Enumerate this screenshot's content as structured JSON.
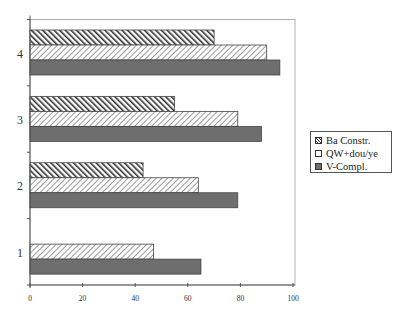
{
  "chart_data": {
    "type": "bar",
    "orientation": "horizontal",
    "title": "",
    "xlabel": "",
    "ylabel": "",
    "categories": [
      "1",
      "2",
      "3",
      "4"
    ],
    "series": [
      {
        "name": "Ba Constr.",
        "values": [
          0,
          43,
          55,
          70
        ],
        "pattern": "dense-backslash-hatch"
      },
      {
        "name": "QW+dou/ye",
        "values": [
          47,
          64,
          79,
          90
        ],
        "pattern": "light-slash-hatch"
      },
      {
        "name": "V-Compl.",
        "values": [
          65,
          79,
          88,
          95
        ],
        "pattern": "solid-dark-gray"
      }
    ],
    "xlim": [
      0,
      100
    ],
    "xticks": [
      0,
      20,
      40,
      60,
      80,
      100
    ],
    "xtick_labels": [
      "0",
      "20",
      "40",
      "60",
      "80",
      "100"
    ],
    "grid": false,
    "legend_position": "right"
  },
  "legend": {
    "items": [
      {
        "label": "Ba Constr."
      },
      {
        "label": "QW+dou/ye"
      },
      {
        "label": "V-Compl."
      }
    ]
  },
  "colors": {
    "frame": "#b0b0b0",
    "axis": "#555555",
    "ba_hatch": "#333333",
    "qw_hatch": "#9a9a9a",
    "v_fill": "#6e6e6e"
  }
}
